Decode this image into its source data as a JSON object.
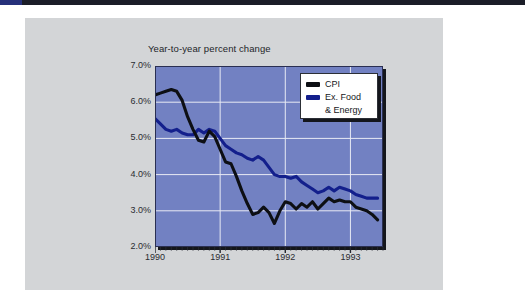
{
  "page": {
    "background_color": "#ffffff",
    "card_color": "#d3d5d7",
    "top_bar_color": "#1b1d28",
    "top_bar_accent_color": "#26307a"
  },
  "chart_data": {
    "type": "line",
    "title": "",
    "subtitle": "Year-to-year percent change",
    "xlabel": "",
    "ylabel": "",
    "plot_background_color": "#7281c2",
    "gridline_color": "#e8eaf4",
    "grid": true,
    "legend_position": "top-right",
    "ylim": [
      2.0,
      7.0
    ],
    "ytick_labels": [
      "7.0%",
      "6.0%",
      "5.0%",
      "4.0%",
      "3.0%",
      "2.0%"
    ],
    "ytick_values": [
      7.0,
      6.0,
      5.0,
      4.0,
      3.0,
      2.0
    ],
    "xlim": [
      1990.0,
      1993.5
    ],
    "xtick_labels": [
      "1990",
      "1991",
      "1992",
      "1993"
    ],
    "xtick_values": [
      1990.0,
      1991.0,
      1992.0,
      1993.0
    ],
    "minor_ticks": "monthly",
    "x": [
      1990.0,
      1990.083,
      1990.167,
      1990.25,
      1990.333,
      1990.417,
      1990.5,
      1990.583,
      1990.667,
      1990.75,
      1990.833,
      1990.917,
      1991.0,
      1991.083,
      1991.167,
      1991.25,
      1991.333,
      1991.417,
      1991.5,
      1991.583,
      1991.667,
      1991.75,
      1991.833,
      1991.917,
      1992.0,
      1992.083,
      1992.167,
      1992.25,
      1992.333,
      1992.417,
      1992.5,
      1992.583,
      1992.667,
      1992.75,
      1992.833,
      1992.917,
      1993.0,
      1993.083,
      1993.167,
      1993.25,
      1993.333,
      1993.417
    ],
    "series": [
      {
        "name": "CPI",
        "color": "#0d0f14",
        "values": [
          6.2,
          6.25,
          6.3,
          6.35,
          6.3,
          6.05,
          5.6,
          5.25,
          4.95,
          4.9,
          5.2,
          5.05,
          4.7,
          4.35,
          4.3,
          3.95,
          3.55,
          3.2,
          2.9,
          2.95,
          3.1,
          2.95,
          2.65,
          3.0,
          3.25,
          3.2,
          3.05,
          3.2,
          3.1,
          3.25,
          3.05,
          3.2,
          3.35,
          3.25,
          3.3,
          3.25,
          3.25,
          3.1,
          3.05,
          3.0,
          2.9,
          2.75
        ]
      },
      {
        "name": "Ex. Food & Energy",
        "color": "#131f8c",
        "values": [
          5.55,
          5.4,
          5.25,
          5.2,
          5.25,
          5.15,
          5.1,
          5.1,
          5.25,
          5.15,
          5.25,
          5.2,
          5.0,
          4.8,
          4.7,
          4.6,
          4.55,
          4.45,
          4.4,
          4.5,
          4.4,
          4.2,
          4.0,
          3.95,
          3.95,
          3.9,
          3.95,
          3.8,
          3.7,
          3.6,
          3.5,
          3.55,
          3.65,
          3.55,
          3.65,
          3.6,
          3.55,
          3.45,
          3.4,
          3.35,
          3.35,
          3.35
        ]
      }
    ]
  },
  "legend": {
    "items": [
      {
        "label": "CPI",
        "color": "#0d0f14",
        "label2": ""
      },
      {
        "label": "Ex. Food",
        "color": "#131f8c",
        "label2": "& Energy"
      }
    ]
  }
}
